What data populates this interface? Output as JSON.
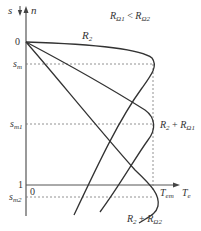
{
  "diagram": {
    "title_condition": "RΩ1 < RΩ2",
    "axes": {
      "vertical_label_s": "s",
      "vertical_label_n": "n",
      "horizontal_label": "T",
      "horizontal_label_sub": "e",
      "origin_label": "0",
      "origin2_label": "0",
      "one_label": "1"
    },
    "marks": {
      "sm": {
        "main": "s",
        "sub": "m"
      },
      "sm1": {
        "main": "s",
        "sub": "m1"
      },
      "sm2": {
        "main": "s",
        "sub": "m2"
      },
      "tem": {
        "main": "T",
        "sub": "em"
      }
    },
    "curves": [
      {
        "name": "R2",
        "label_main": "R",
        "label_sub": "2",
        "peak_s": "sm"
      },
      {
        "name": "R2+RΩ1",
        "label_main": "R",
        "label_sub": "2",
        "label_plus": " + R",
        "label_sub2": "Ω1",
        "peak_s": "sm1"
      },
      {
        "name": "R2+RΩ2",
        "label_main": "R",
        "label_sub": "2",
        "label_plus": " + R",
        "label_sub2": "Ω2",
        "peak_s": "sm2"
      }
    ],
    "colors": {
      "line": "#333333",
      "dashed": "#777777"
    }
  }
}
